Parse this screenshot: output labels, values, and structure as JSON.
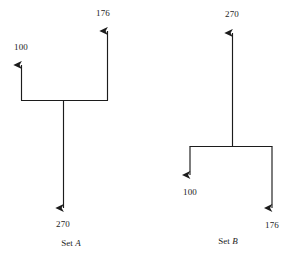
{
  "figure": {
    "background_color": "#ffffff",
    "line_color": "#1c1c1c",
    "text_color": "#1c1c1c",
    "width": 292,
    "height": 267
  },
  "sets": [
    {
      "id": "set-a",
      "caption_prefix": "Set ",
      "caption_letter": "A",
      "caption_full": "Set A",
      "direction": "merge",
      "inputs": [
        {
          "label": "100",
          "value": 100,
          "arrow": "up"
        },
        {
          "label": "176",
          "value": 176,
          "arrow": "up"
        }
      ],
      "outputs": [
        {
          "label": "270",
          "value": 270,
          "arrow": "down"
        }
      ]
    },
    {
      "id": "set-b",
      "caption_prefix": "Set ",
      "caption_letter": "B",
      "caption_full": "Set B",
      "direction": "split",
      "inputs": [
        {
          "label": "270",
          "value": 270,
          "arrow": "up"
        }
      ],
      "outputs": [
        {
          "label": "100",
          "value": 100,
          "arrow": "down"
        },
        {
          "label": "176",
          "value": 176,
          "arrow": "down"
        }
      ]
    }
  ],
  "labels": {
    "a_left": "100",
    "a_right": "176",
    "a_stem": "270",
    "a_caption_prefix": "Set ",
    "a_caption_letter": "A",
    "b_top": "270",
    "b_left": "100",
    "b_right": "176",
    "b_caption_prefix": "Set ",
    "b_caption_letter": "B"
  }
}
